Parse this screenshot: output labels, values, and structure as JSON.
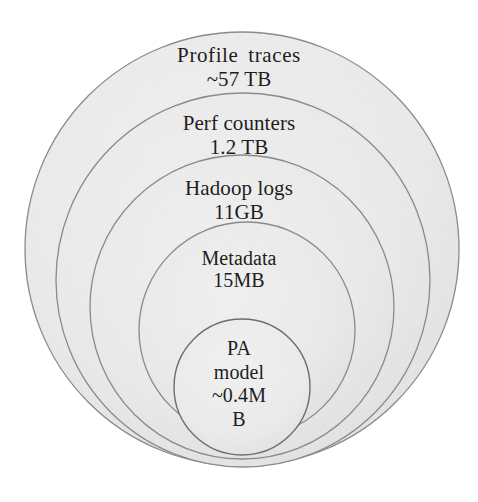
{
  "diagram": {
    "type": "nested-circles",
    "title": "",
    "background_color": "#ffffff",
    "fill_color": "#ececec",
    "stroke_color": "#8a8a8a",
    "text_color": "#1d1d1d",
    "rings": [
      {
        "id": "profile-traces",
        "name": "Profile  traces",
        "size": "~57 TB",
        "cx": 242,
        "cy": 249,
        "r": 217
      },
      {
        "id": "perf-counters",
        "name": "Perf counters",
        "size": "1.2 TB",
        "cx": 243,
        "cy": 280,
        "r": 187
      },
      {
        "id": "hadoop-logs",
        "name": "Hadoop logs",
        "size": "11GB",
        "cx": 242,
        "cy": 307,
        "r": 152
      },
      {
        "id": "metadata",
        "name": "Metadata",
        "size": "15MB",
        "cx": 247,
        "cy": 330,
        "r": 108
      },
      {
        "id": "pa-model",
        "name": "PA",
        "size": "model",
        "extra_line_1": "~0.4M",
        "extra_line_2": "B",
        "cx": 242,
        "cy": 387,
        "r": 68
      }
    ]
  },
  "chart_data": {
    "type": "pie",
    "title": "",
    "categories": [
      "Profile traces",
      "Perf counters",
      "Hadoop logs",
      "Metadata",
      "PA model"
    ],
    "labels": [
      "~57 TB",
      "1.2 TB",
      "11GB",
      "15MB",
      "~0.4MB"
    ],
    "values": [
      57,
      1.2,
      0.011,
      1.5e-05,
      4e-10
    ],
    "units": "TB",
    "xlabel": "",
    "ylabel": "",
    "legend": "none",
    "grid": false
  }
}
